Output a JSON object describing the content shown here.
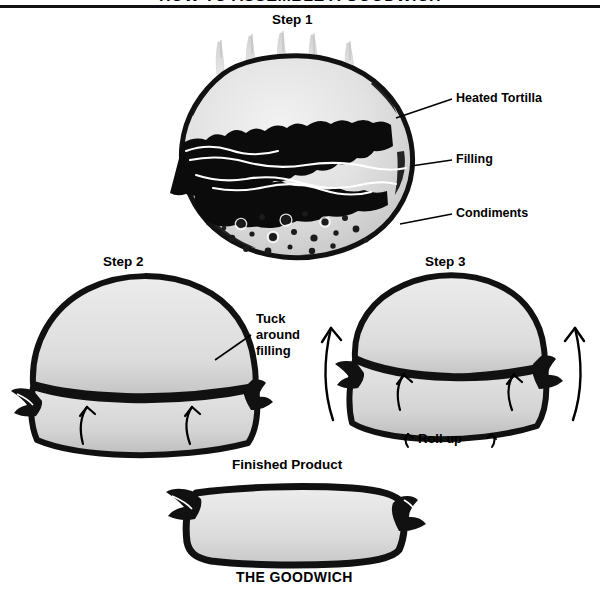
{
  "document": {
    "title": "HOW TO ASSEMBLE A GOODWICH",
    "title_cropped": true
  },
  "steps": [
    {
      "id": "step-1",
      "label": "Step 1"
    },
    {
      "id": "step-2",
      "label": "Step 2"
    },
    {
      "id": "step-3",
      "label": "Step 3"
    }
  ],
  "callouts": [
    {
      "id": "heated-tortilla",
      "label": "Heated Tortilla"
    },
    {
      "id": "filling",
      "label": "Filling"
    },
    {
      "id": "condiments",
      "label": "Condiments"
    }
  ],
  "instructions": {
    "tuck_line_1": "Tuck",
    "tuck_line_2": "around",
    "tuck_line_3": "filling",
    "roll_up": "Roll up"
  },
  "finished": {
    "caption": "Finished Product",
    "brand": "THE GOODWICH"
  },
  "colors": {
    "ink": "#000000",
    "paper": "#ffffff",
    "tortilla_light": "#e9e9e9",
    "tortilla_mid": "#d6d6d6",
    "tortilla_shadow": "#b9b9b9",
    "crust_dark": "#151515"
  }
}
